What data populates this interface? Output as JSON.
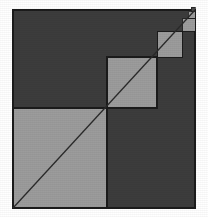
{
  "figure": {
    "type": "geometric-diagram",
    "canvas": {
      "width": 208,
      "height": 217,
      "background": "#ffffff"
    },
    "colors": {
      "background": "#ffffff",
      "dark_fill": "#3c3c3c",
      "light_fill": "#9c9c9c",
      "outline": "#1b1b1b",
      "diagonal_line": "#2a2a2a"
    },
    "outer_square": {
      "label": "outer-square",
      "x": 13,
      "y": 10,
      "width": 182,
      "height": 198,
      "fill": "#3c3c3c",
      "stroke": "#1b1b1b",
      "stroke_width": 1.6
    },
    "diagonal": {
      "label": "main-diagonal",
      "x1": 13,
      "y1": 208,
      "x2": 195,
      "y2": 10,
      "stroke": "#2a2a2a",
      "stroke_width": 1.3
    },
    "nested_squares": [
      {
        "index": 1,
        "label": "square-level-1",
        "x": 13,
        "y": 108,
        "width": 94,
        "height": 100,
        "fill": "#9c9c9c",
        "stroke": "#1b1b1b",
        "stroke_width": 1.2
      },
      {
        "index": 2,
        "label": "square-level-2",
        "x": 107,
        "y": 57,
        "width": 50,
        "height": 51,
        "fill": "#9c9c9c",
        "stroke": "#1b1b1b",
        "stroke_width": 1.1
      },
      {
        "index": 3,
        "label": "square-level-3",
        "x": 157,
        "y": 31,
        "width": 25,
        "height": 26,
        "fill": "#9c9c9c",
        "stroke": "#1b1b1b",
        "stroke_width": 1.0
      },
      {
        "index": 4,
        "label": "square-level-4",
        "x": 182,
        "y": 18,
        "width": 13,
        "height": 13,
        "fill": "#9c9c9c",
        "stroke": "#1b1b1b",
        "stroke_width": 0.9
      },
      {
        "index": 5,
        "label": "square-level-5",
        "x": 188,
        "y": 11,
        "width": 7,
        "height": 7,
        "fill": "#9c9c9c",
        "stroke": "#1b1b1b",
        "stroke_width": 0.8
      },
      {
        "index": 6,
        "label": "square-level-6",
        "x": 191,
        "y": 7,
        "width": 4,
        "height": 4,
        "fill": "#4a4a4a",
        "stroke": "#1b1b1b",
        "stroke_width": 0.7
      }
    ]
  }
}
